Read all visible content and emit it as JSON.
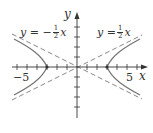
{
  "diagram": {
    "type": "hyperbola-graph",
    "axes": {
      "x_label": "x",
      "y_label": "y",
      "x_tick_labels": [
        {
          "value": -5,
          "text": "−5"
        },
        {
          "value": 5,
          "text": "5"
        }
      ],
      "x_range": [
        -6.5,
        6.5
      ],
      "y_range": [
        -5,
        5
      ],
      "tick_spacing": 1
    },
    "asymptotes": [
      {
        "equation_lhs": "y = −",
        "frac_num": "1",
        "frac_den": "2",
        "var": "x",
        "slope": -0.5,
        "style": "dashed"
      },
      {
        "equation_lhs": "y = ",
        "frac_num": "1",
        "frac_den": "2",
        "var": "x",
        "slope": 0.5,
        "style": "dashed"
      }
    ],
    "hyperbola": {
      "vertices": [
        -3,
        3
      ],
      "orientation": "horizontal",
      "vertex_points_marked": true
    },
    "colors": {
      "axis": "#333333",
      "curve": "#777777",
      "asymptote": "#888888",
      "text": "#333333"
    }
  }
}
